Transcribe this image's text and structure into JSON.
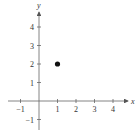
{
  "chart_data": {
    "type": "scatter",
    "title": "",
    "xlabel": "x",
    "ylabel": "y",
    "xlim": [
      -1.5,
      4.8
    ],
    "ylim": [
      -1.5,
      4.8
    ],
    "grid": false,
    "x_ticks": [
      -1,
      1,
      2,
      3,
      4
    ],
    "y_ticks": [
      -1,
      1,
      2,
      3,
      4
    ],
    "x_tick_labels": [
      "−1",
      "1",
      "2",
      "3",
      "4"
    ],
    "y_tick_labels": [
      "−1",
      "1",
      "2",
      "3",
      "4"
    ],
    "series": [
      {
        "name": "point",
        "points": [
          {
            "x": 1,
            "y": 2
          }
        ]
      }
    ]
  }
}
